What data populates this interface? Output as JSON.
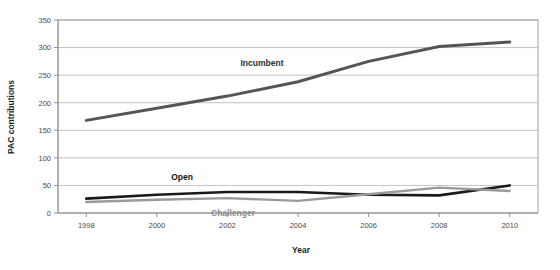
{
  "chart_data": {
    "type": "line",
    "title": "",
    "xlabel": "Year",
    "ylabel": "PAC contributions",
    "x": [
      1998,
      2000,
      2002,
      2004,
      2006,
      2008,
      2010
    ],
    "xtick_labels": [
      "1998",
      "2000",
      "2002",
      "2004",
      "2006",
      "2008",
      "2010"
    ],
    "xlim": [
      1997.2,
      2010.8
    ],
    "ylim": [
      0,
      350
    ],
    "ytick_labels": [
      "0",
      "50",
      "100",
      "150",
      "200",
      "250",
      "300",
      "350"
    ],
    "yticks": [
      0,
      50,
      100,
      150,
      200,
      250,
      300,
      350
    ],
    "grid": "horizontal",
    "legend_position": "inline-annotations",
    "series": [
      {
        "name": "Incumbent",
        "color": "#555555",
        "values": [
          168,
          190,
          212,
          238,
          275,
          302,
          310
        ],
        "label_text": "Incumbent"
      },
      {
        "name": "Open",
        "color": "#1a1a1a",
        "values": [
          26,
          33,
          38,
          38,
          33,
          32,
          50
        ],
        "label_text": "Open"
      },
      {
        "name": "Challenger",
        "color": "#9a9a9a",
        "values": [
          20,
          24,
          27,
          22,
          34,
          46,
          40
        ],
        "label_text": "Challenger"
      }
    ]
  },
  "axis": {
    "x_title": "Year",
    "y_title": "PAC contributions"
  },
  "colors": {
    "incumbent": "#555555",
    "open": "#1a1a1a",
    "challenger": "#9a9a9a",
    "gridline": "#b4b4b4",
    "axis": "#8a8a8a",
    "background": "#ffffff"
  }
}
